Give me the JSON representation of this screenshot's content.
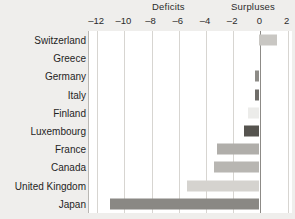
{
  "chart_data": {
    "type": "bar",
    "orientation": "horizontal",
    "title": "",
    "subtitle": "",
    "xlabel": "",
    "ylabel": "",
    "xlim": [
      -12.6,
      2.4
    ],
    "grid": true,
    "legend": "none",
    "band_labels": {
      "negative": "Deficits",
      "positive": "Surpluses"
    },
    "ticks": [
      -12,
      -10,
      -8,
      -6,
      -4,
      -2,
      0,
      2
    ],
    "tick_labels": [
      "–12",
      "–10",
      "–8",
      "–6",
      "–4",
      "–2",
      "0",
      "2"
    ],
    "categories": [
      "Switzerland",
      "Greece",
      "Germany",
      "Italy",
      "Finland",
      "Luxembourg",
      "France",
      "Canada",
      "United Kingdom",
      "Japan"
    ],
    "values": [
      1.3,
      0.0,
      -0.3,
      -0.3,
      -0.8,
      -1.1,
      -3.1,
      -3.3,
      -5.3,
      -11.0
    ],
    "bar_colors": [
      "#c9c7c3",
      "#ffffff",
      "#8d8b87",
      "#6f6d69",
      "#ececea",
      "#56544f",
      "#b0aeaa",
      "#b8b6b2",
      "#d5d3cf",
      "#8a8884"
    ]
  },
  "colors": {
    "page_background": "#efeeec",
    "plot_background": "#ffffff",
    "gridline": "#d7d5d1",
    "zero_line": "#8d8b87",
    "text": "#1f1f1f"
  }
}
